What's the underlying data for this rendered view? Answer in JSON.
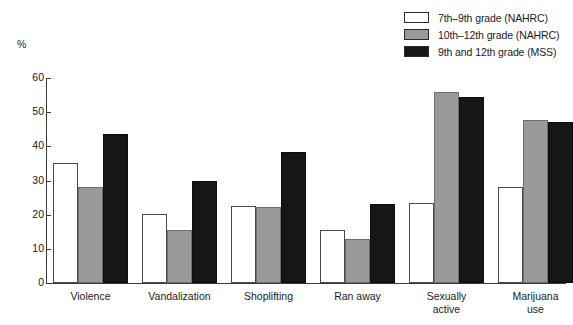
{
  "axis_unit": "%",
  "legend": {
    "items": [
      {
        "label": "7th–9th grade (NAHRC)",
        "color": "#ffffff",
        "name": "legend-swatch-7th-9th"
      },
      {
        "label": "10th–12th grade (NAHRC)",
        "color": "#9a9a9a",
        "name": "legend-swatch-10th-12th"
      },
      {
        "label": "9th and 12th grade (MSS)",
        "color": "#161616",
        "name": "legend-swatch-9th-12th-mss"
      }
    ]
  },
  "chart_data": {
    "type": "bar",
    "title": "",
    "xlabel": "",
    "ylabel": "%",
    "ylim": [
      0,
      60
    ],
    "yticks": [
      0,
      10,
      20,
      30,
      40,
      50,
      60
    ],
    "grid": false,
    "legend_position": "top-right",
    "categories": [
      "Violence",
      "Vandalization",
      "Shoplifting",
      "Ran away",
      "Sexually\nactive",
      "Marijuana\nuse"
    ],
    "series": [
      {
        "name": "7th–9th grade (NAHRC)",
        "color": "#ffffff",
        "values": [
          35.2,
          20.3,
          22.6,
          15.4,
          23.4,
          28.0
        ]
      },
      {
        "name": "10th–12th grade (NAHRC)",
        "color": "#9a9a9a",
        "values": [
          28.0,
          15.4,
          22.3,
          13.0,
          55.8,
          47.8
        ]
      },
      {
        "name": "9th and 12th grade (MSS)",
        "color": "#161616",
        "values": [
          43.6,
          29.8,
          38.4,
          23.2,
          54.5,
          47.0
        ]
      }
    ]
  }
}
